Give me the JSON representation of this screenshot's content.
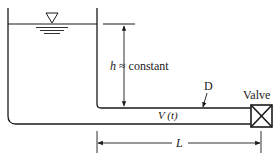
{
  "diagram": {
    "type": "reservoir-pipe-valve schematic",
    "labels": {
      "head": "h",
      "head_relation": "≈ constant",
      "diameter": "D",
      "velocity": "V (t)",
      "length": "L",
      "valve": "Valve"
    },
    "symbols": {
      "free_surface": "inverted-triangle-water-surface-icon",
      "valve": "crossed-box-valve-icon"
    },
    "colors": {
      "line": "#1a1a1a",
      "background": "#ffffff"
    }
  }
}
